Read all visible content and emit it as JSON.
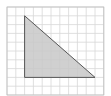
{
  "diagram": {
    "type": "right-triangle-on-grid",
    "grid": {
      "columns": 11,
      "rows": 10,
      "x0": 7,
      "y0": 7,
      "cell": 8.8,
      "line_color": "#d8d8d8",
      "border_color": "#bdbdbd"
    },
    "triangle": {
      "vertices_grid": [
        [
          2,
          1
        ],
        [
          2,
          8
        ],
        [
          10,
          8
        ]
      ],
      "fill": "#c8c8c8",
      "stroke": "#555555"
    }
  }
}
